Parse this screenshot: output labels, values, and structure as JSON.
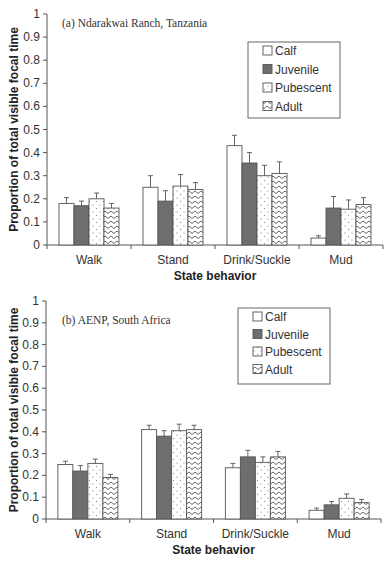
{
  "figure": {
    "legend": [
      {
        "key": "calf",
        "label": "Calf",
        "pattern": "white"
      },
      {
        "key": "juvenile",
        "label": "Juvenile",
        "pattern": "dark-gray"
      },
      {
        "key": "pubescent",
        "label": "Pubescent",
        "pattern": "dots"
      },
      {
        "key": "adult",
        "label": "Adult",
        "pattern": "zigzag"
      }
    ],
    "colors": {
      "axis": "#555555",
      "bar_outline": "#555555",
      "juvenile_fill": "#6e6e6e",
      "background": "#ffffff"
    }
  },
  "chart_data": [
    {
      "type": "bar",
      "title": "(a) Ndarakwai Ranch, Tanzania",
      "xlabel": "State behavior",
      "ylabel": "Proportion of total visible focal time",
      "ylim": [
        0,
        1
      ],
      "yticks": [
        "0",
        "0.1",
        "0.2",
        "0.3",
        "0.4",
        "0.5",
        "0.6",
        "0.7",
        "0.8",
        "0.9",
        "1"
      ],
      "categories": [
        "Walk",
        "Stand",
        "Drink/Suckle",
        "Mud"
      ],
      "grid": false,
      "legend_position": "upper right",
      "error_bars": true,
      "series": [
        {
          "name": "Calf",
          "values": [
            0.18,
            0.25,
            0.43,
            0.03
          ],
          "errors": [
            0.025,
            0.05,
            0.045,
            0.01
          ]
        },
        {
          "name": "Juvenile",
          "values": [
            0.17,
            0.19,
            0.355,
            0.16
          ],
          "errors": [
            0.02,
            0.045,
            0.045,
            0.05
          ]
        },
        {
          "name": "Pubescent",
          "values": [
            0.2,
            0.255,
            0.3,
            0.155
          ],
          "errors": [
            0.025,
            0.05,
            0.045,
            0.04
          ]
        },
        {
          "name": "Adult",
          "values": [
            0.16,
            0.24,
            0.31,
            0.175
          ],
          "errors": [
            0.02,
            0.03,
            0.05,
            0.03
          ]
        }
      ]
    },
    {
      "type": "bar",
      "title": "(b) AENP, South Africa",
      "xlabel": "State behavior",
      "ylabel": "Proportion of total visible focal time",
      "ylim": [
        0,
        1
      ],
      "yticks": [
        "0",
        "0.1",
        "0.2",
        "0.3",
        "0.4",
        "0.5",
        "0.6",
        "0.7",
        "0.8",
        "0.9",
        "1"
      ],
      "categories": [
        "Walk",
        "Stand",
        "Drink/Suckle",
        "Mud"
      ],
      "grid": false,
      "legend_position": "upper right",
      "error_bars": true,
      "series": [
        {
          "name": "Calf",
          "values": [
            0.25,
            0.41,
            0.235,
            0.04
          ],
          "errors": [
            0.015,
            0.02,
            0.02,
            0.01
          ]
        },
        {
          "name": "Juvenile",
          "values": [
            0.22,
            0.38,
            0.285,
            0.065
          ],
          "errors": [
            0.025,
            0.025,
            0.03,
            0.015
          ]
        },
        {
          "name": "Pubescent",
          "values": [
            0.255,
            0.405,
            0.26,
            0.095
          ],
          "errors": [
            0.02,
            0.03,
            0.025,
            0.02
          ]
        },
        {
          "name": "Adult",
          "values": [
            0.19,
            0.41,
            0.285,
            0.075
          ],
          "errors": [
            0.015,
            0.02,
            0.025,
            0.015
          ]
        }
      ]
    }
  ]
}
